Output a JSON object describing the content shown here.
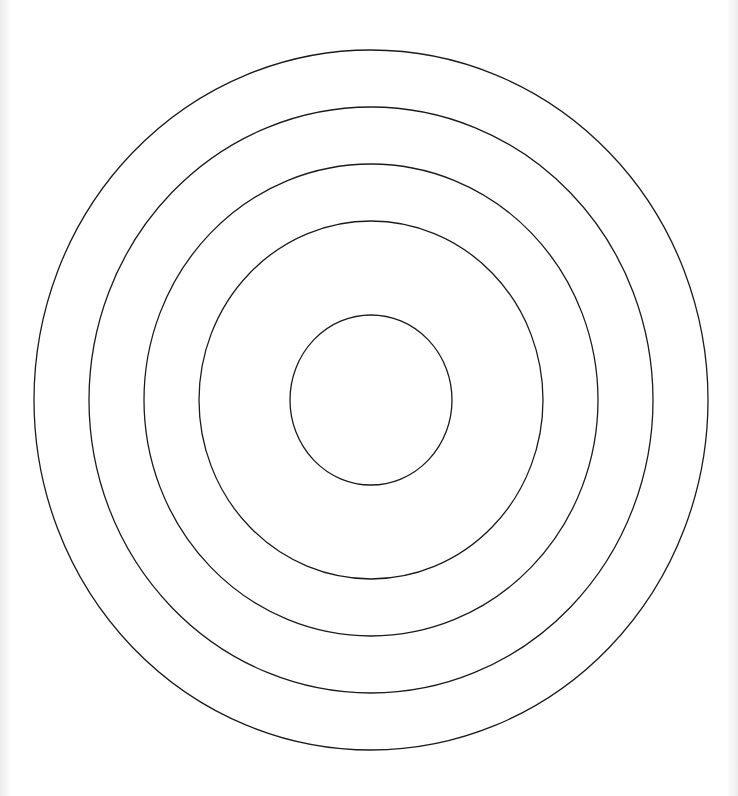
{
  "diagram": {
    "type": "concentric-rings",
    "center": {
      "x": 371,
      "y": 400
    },
    "stroke_color": "#1a1a1a",
    "stroke_width": 1.3,
    "background": "#ffffff",
    "rings": [
      {
        "rx": 337,
        "ry": 350
      },
      {
        "rx": 282,
        "ry": 293
      },
      {
        "rx": 227,
        "ry": 236
      },
      {
        "rx": 172,
        "ry": 179
      },
      {
        "rx": 81,
        "ry": 85
      }
    ]
  }
}
